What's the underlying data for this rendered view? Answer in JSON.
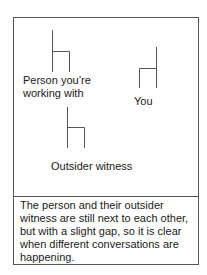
{
  "figures": {
    "person": {
      "label_line1": "Person you’re",
      "label_line2": "working with"
    },
    "you": {
      "label": "You"
    },
    "witness": {
      "label": "Outsider witness"
    }
  },
  "caption": "The person and their outsider witness are still next to each other, but with a slight gap, so it is clear when different conversations are happening.",
  "colors": {
    "line": "#555555",
    "text": "#1a1a1a"
  }
}
